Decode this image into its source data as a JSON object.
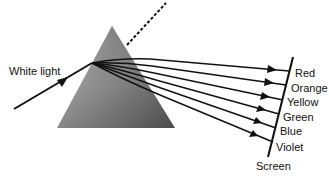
{
  "diagram": {
    "labels": {
      "input": "White light",
      "screen": "Screen"
    },
    "spectrum": [
      {
        "name": "Red",
        "y": 71
      },
      {
        "name": "Orange",
        "y": 85
      },
      {
        "name": "Yellow",
        "y": 100
      },
      {
        "name": "Green",
        "y": 114
      },
      {
        "name": "Blue",
        "y": 128
      },
      {
        "name": "Violet",
        "y": 142
      }
    ],
    "colors": {
      "line": "#111111",
      "prism_dark": "#555555",
      "prism_light": "#e8e8e8",
      "background": "#ffffff"
    }
  }
}
